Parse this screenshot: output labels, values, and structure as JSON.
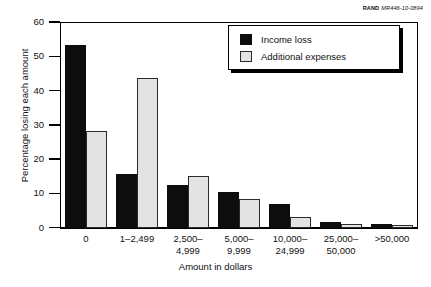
{
  "credit": {
    "org": "RAND",
    "code": "MR446-10-0894"
  },
  "chart_data": {
    "type": "bar",
    "title": "",
    "xlabel": "Amount in dollars",
    "ylabel": "Percentage losing each amount",
    "ylim": [
      0,
      60
    ],
    "yticks": [
      0,
      10,
      20,
      30,
      40,
      50,
      60
    ],
    "ytick_labels": [
      "0",
      "10",
      "20",
      "30",
      "40",
      "50",
      "60"
    ],
    "grid": false,
    "legend_position": "top-right",
    "categories": [
      "0",
      "1–2,499",
      "2,500–\n4,999",
      "5,000–\n9,999",
      "10,000–\n24,999",
      "25,000–\n50,000",
      ">50,000"
    ],
    "category_lines": [
      [
        "0"
      ],
      [
        "1–2,499"
      ],
      [
        "2,500–",
        "4,999"
      ],
      [
        "5,000–",
        "9,999"
      ],
      [
        "10,000–",
        "24,999"
      ],
      [
        "25,000–",
        "50,000"
      ],
      [
        ">50,000"
      ]
    ],
    "series": [
      {
        "name": "Income loss",
        "color": "#0d0d0d",
        "values": [
          53.3,
          15.6,
          12.5,
          10.5,
          6.8,
          1.6,
          1.0
        ]
      },
      {
        "name": "Additional expenses",
        "color": "#e3e3e3",
        "values": [
          28.3,
          43.8,
          15.1,
          8.3,
          3.1,
          1.0,
          0.6
        ]
      }
    ]
  }
}
